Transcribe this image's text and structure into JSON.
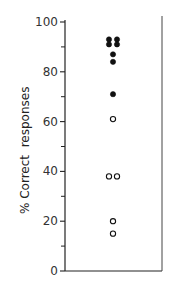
{
  "chart_data": {
    "type": "scatter",
    "title": "",
    "xlabel": "",
    "ylabel": "% Correct  responses",
    "ylim": [
      0,
      100
    ],
    "yticks_major": [
      0,
      20,
      40,
      60,
      80,
      100
    ],
    "yticks_minor": [
      10,
      30,
      50,
      70,
      90
    ],
    "tick_labels": [
      "0",
      "20",
      "40",
      "60",
      "80",
      "100"
    ],
    "grid": false,
    "legend": null,
    "series": [
      {
        "name": "filled",
        "marker": "filled-circle",
        "color": "#111111",
        "points": [
          {
            "x": -1,
            "y": 93
          },
          {
            "x": 1,
            "y": 93
          },
          {
            "x": -1,
            "y": 91
          },
          {
            "x": 1,
            "y": 91
          },
          {
            "x": 0,
            "y": 87
          },
          {
            "x": 0,
            "y": 84
          },
          {
            "x": 0,
            "y": 71
          }
        ]
      },
      {
        "name": "open",
        "marker": "open-circle",
        "color": "#111111",
        "points": [
          {
            "x": 0,
            "y": 61
          },
          {
            "x": -1,
            "y": 38
          },
          {
            "x": 1,
            "y": 38
          },
          {
            "x": 0,
            "y": 20
          },
          {
            "x": 0,
            "y": 15
          }
        ]
      }
    ]
  }
}
